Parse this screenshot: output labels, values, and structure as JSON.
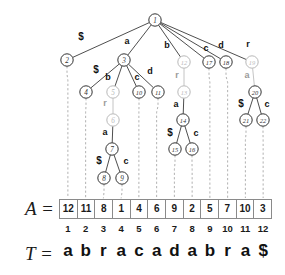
{
  "figure": {
    "kind": "suffix-tree-and-suffix-array",
    "array_label": "A =",
    "text_label": "T =",
    "suffix_array": [
      12,
      11,
      8,
      1,
      4,
      6,
      9,
      2,
      5,
      7,
      10,
      3
    ],
    "indices": [
      1,
      2,
      3,
      4,
      5,
      6,
      7,
      8,
      9,
      10,
      11,
      12
    ],
    "text_chars": [
      "a",
      "b",
      "r",
      "a",
      "c",
      "a",
      "d",
      "a",
      "b",
      "r",
      "a",
      "$"
    ],
    "colors": {
      "node_dark": "#333333",
      "node_gray": "#b9b9b9",
      "edge_dark": "#3a3a3a",
      "edge_gray": "#bdbdbd",
      "dashed": "#a8a8a8",
      "box_border": "#8a8a8a",
      "text": "#1a1a1a"
    },
    "nodes": [
      {
        "id": "1",
        "label": "1",
        "x": 155,
        "y": 20,
        "shade": "dark"
      },
      {
        "id": "2",
        "label": "2",
        "x": 67,
        "y": 60,
        "shade": "dark"
      },
      {
        "id": "3",
        "label": "3",
        "x": 124,
        "y": 60,
        "shade": "dark"
      },
      {
        "id": "4",
        "label": "4",
        "x": 86,
        "y": 92,
        "shade": "dark"
      },
      {
        "id": "5",
        "label": "5",
        "x": 113,
        "y": 92,
        "shade": "gray"
      },
      {
        "id": "6",
        "label": "6",
        "x": 113,
        "y": 120,
        "shade": "gray"
      },
      {
        "id": "7",
        "label": "7",
        "x": 112,
        "y": 149,
        "shade": "dark"
      },
      {
        "id": "8",
        "label": "8",
        "x": 104,
        "y": 178,
        "shade": "dark"
      },
      {
        "id": "9",
        "label": "9",
        "x": 122,
        "y": 178,
        "shade": "dark"
      },
      {
        "id": "10",
        "label": "10",
        "x": 139,
        "y": 92,
        "shade": "dark"
      },
      {
        "id": "11",
        "label": "11",
        "x": 158,
        "y": 92,
        "shade": "dark"
      },
      {
        "id": "12",
        "label": "12",
        "x": 184,
        "y": 62,
        "shade": "gray"
      },
      {
        "id": "13",
        "label": "13",
        "x": 184,
        "y": 92,
        "shade": "gray"
      },
      {
        "id": "14",
        "label": "14",
        "x": 183,
        "y": 120,
        "shade": "dark"
      },
      {
        "id": "15",
        "label": "15",
        "x": 175,
        "y": 149,
        "shade": "dark"
      },
      {
        "id": "16",
        "label": "16",
        "x": 192,
        "y": 149,
        "shade": "dark"
      },
      {
        "id": "17",
        "label": "17",
        "x": 209,
        "y": 62,
        "shade": "dark"
      },
      {
        "id": "18",
        "label": "18",
        "x": 226,
        "y": 62,
        "shade": "dark"
      },
      {
        "id": "19",
        "label": "19",
        "x": 252,
        "y": 62,
        "shade": "gray"
      },
      {
        "id": "20",
        "label": "20",
        "x": 255,
        "y": 92,
        "shade": "dark"
      },
      {
        "id": "21",
        "label": "21",
        "x": 246,
        "y": 120,
        "shade": "dark"
      },
      {
        "id": "22",
        "label": "22",
        "x": 263,
        "y": 120,
        "shade": "dark"
      }
    ],
    "edges": [
      {
        "from": "1",
        "to": "2",
        "label": "$",
        "lx": 81,
        "ly": 40,
        "shade": "dark"
      },
      {
        "from": "1",
        "to": "3",
        "label": "a",
        "lx": 127,
        "ly": 44,
        "shade": "dark"
      },
      {
        "from": "1",
        "to": "12",
        "label": "b",
        "lx": 167,
        "ly": 48,
        "shade": "dark"
      },
      {
        "from": "1",
        "to": "17",
        "label": "c",
        "lx": 206,
        "ly": 51,
        "shade": "dark"
      },
      {
        "from": "1",
        "to": "18",
        "label": "d",
        "lx": 221,
        "ly": 48,
        "shade": "dark"
      },
      {
        "from": "1",
        "to": "19",
        "label": "r",
        "lx": 248,
        "ly": 47,
        "shade": "dark"
      },
      {
        "from": "3",
        "to": "4",
        "label": "$",
        "lx": 96,
        "ly": 73,
        "shade": "dark"
      },
      {
        "from": "3",
        "to": "5",
        "label": "b",
        "lx": 108,
        "ly": 80,
        "shade": "dark"
      },
      {
        "from": "3",
        "to": "10",
        "label": "c",
        "lx": 137,
        "ly": 80,
        "shade": "dark"
      },
      {
        "from": "3",
        "to": "11",
        "label": "d",
        "lx": 150,
        "ly": 74,
        "shade": "dark"
      },
      {
        "from": "5",
        "to": "6",
        "label": "r",
        "lx": 105,
        "ly": 106,
        "shade": "gray"
      },
      {
        "from": "6",
        "to": "7",
        "label": "a",
        "lx": 105,
        "ly": 135,
        "shade": "dark"
      },
      {
        "from": "7",
        "to": "8",
        "label": "$",
        "lx": 99,
        "ly": 164,
        "shade": "dark"
      },
      {
        "from": "7",
        "to": "9",
        "label": "c",
        "lx": 126,
        "ly": 164,
        "shade": "dark"
      },
      {
        "from": "12",
        "to": "13",
        "label": "r",
        "lx": 177,
        "ly": 78,
        "shade": "gray"
      },
      {
        "from": "13",
        "to": "14",
        "label": "a",
        "lx": 176,
        "ly": 107,
        "shade": "dark"
      },
      {
        "from": "14",
        "to": "15",
        "label": "$",
        "lx": 170,
        "ly": 136,
        "shade": "dark"
      },
      {
        "from": "14",
        "to": "16",
        "label": "c",
        "lx": 196,
        "ly": 136,
        "shade": "dark"
      },
      {
        "from": "19",
        "to": "20",
        "label": "a",
        "lx": 247,
        "ly": 78,
        "shade": "gray"
      },
      {
        "from": "20",
        "to": "21",
        "label": "$",
        "lx": 241,
        "ly": 107,
        "shade": "dark"
      },
      {
        "from": "20",
        "to": "22",
        "label": "c",
        "lx": 267,
        "ly": 107,
        "shade": "dark"
      }
    ],
    "leaf_links": [
      {
        "node": "2",
        "cell": 1
      },
      {
        "node": "4",
        "cell": 2
      },
      {
        "node": "8",
        "cell": 3
      },
      {
        "node": "9",
        "cell": 4
      },
      {
        "node": "10",
        "cell": 5
      },
      {
        "node": "11",
        "cell": 6
      },
      {
        "node": "15",
        "cell": 7
      },
      {
        "node": "16",
        "cell": 8
      },
      {
        "node": "17",
        "cell": 9
      },
      {
        "node": "18",
        "cell": 10
      },
      {
        "node": "21",
        "cell": 11
      },
      {
        "node": "22",
        "cell": 12
      }
    ]
  }
}
